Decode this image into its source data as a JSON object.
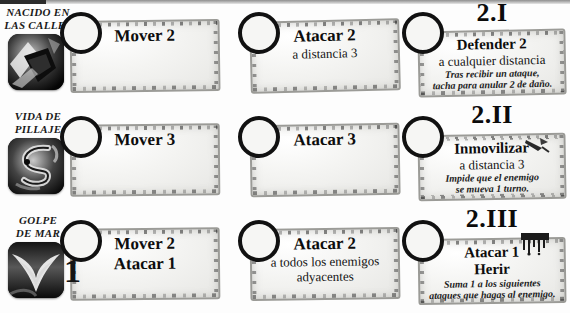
{
  "sheet": {
    "title": "Hoja de habilidades de heroe",
    "columns": [
      "Movimiento",
      "Ataque",
      "Habilidad especial"
    ],
    "ink_color": "#111111",
    "parchment_color": "#f2f2ef"
  },
  "rows": [
    {
      "hero": {
        "name": "NACIDO EN LAS CALLES",
        "name_line1": "NACIDO EN",
        "name_line2": "LAS CALLES",
        "avatar_icon": "dark-shard-avatar-icon"
      },
      "move": {
        "token": "",
        "title": "Mover 2",
        "sub": "",
        "note": ""
      },
      "attack": {
        "token": "",
        "title": "Atacar 2",
        "sub": "a distancia 3",
        "note": ""
      },
      "special": {
        "tier": "2.I",
        "token": "",
        "title": "Defender 2",
        "sub": "a cualquier distancia",
        "note": "Tras recibir un ataque, tacha para anular 2 de daño.",
        "note_line1": "Tras recibir un ataque,",
        "note_line2": "tacha para anular 2 de daño.",
        "glyph": ""
      }
    },
    {
      "hero": {
        "name": "VIDA DE PILLAJE",
        "name_line1": "VIDA DE",
        "name_line2": "PILLAJE",
        "avatar_icon": "dark-serpent-scroll-avatar-icon"
      },
      "move": {
        "token": "",
        "title": "Mover 3",
        "sub": "",
        "note": ""
      },
      "attack": {
        "token": "",
        "title": "Atacar 3",
        "sub": "",
        "note": ""
      },
      "special": {
        "tier": "2.II",
        "token": "",
        "title": "Inmovilizar",
        "sub": "a distancia 3",
        "note": "Impide que el enemigo se mueva 1 turno.",
        "note_line1": "Impide que el enemigo",
        "note_line2": "se mueva 1 turno.",
        "glyph": "dart-icon"
      }
    },
    {
      "hero": {
        "name": "GOLPE DE MAR",
        "name_line1": "GOLPE",
        "name_line2": "DE MAR",
        "avatar_icon": "dark-wave-avatar-icon"
      },
      "move": {
        "token": "1",
        "title": "Mover 2",
        "sub": "Atacar 1",
        "note": ""
      },
      "attack": {
        "token": "",
        "title": "Atacar 2",
        "sub": "a todos los enemigos adyacentes",
        "sub_line1": "a todos los enemigos",
        "sub_line2": "adyacentes",
        "note": ""
      },
      "special": {
        "tier": "2.III",
        "token": "",
        "title": "Atacar 1",
        "sub": "Herir",
        "note": "Suma 1 a los siguientes ataques que hagas al enemigo.",
        "note_line1": "Suma 1 a los siguientes",
        "note_line2": "ataques que hagas al enemigo.",
        "glyph": "ink-drip-icon"
      }
    }
  ]
}
